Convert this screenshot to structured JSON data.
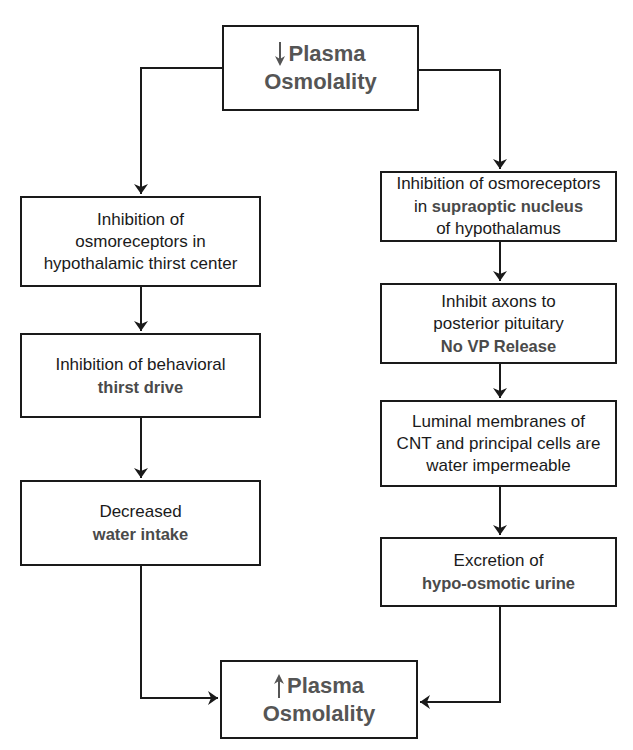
{
  "diagram": {
    "top": {
      "indicator": "decrease",
      "line1": "Plasma",
      "line2": "Osmolality"
    },
    "left_column": [
      {
        "lines": [
          {
            "text": "Inhibition of"
          },
          {
            "text": "osmoreceptors in"
          },
          {
            "text": "hypothalamic thirst center"
          }
        ]
      },
      {
        "lines": [
          {
            "text": "Inhibition of behavioral"
          },
          {
            "text": "thirst drive",
            "emphasis": true
          }
        ]
      },
      {
        "lines": [
          {
            "text": "Decreased"
          },
          {
            "text": "water intake",
            "emphasis": true
          }
        ]
      }
    ],
    "right_column": [
      {
        "lines": [
          {
            "text": "Inhibition of osmoreceptors"
          },
          {
            "pre": "in ",
            "text": "supraoptic nucleus",
            "emphasis": true
          },
          {
            "text": "of hypothalamus"
          }
        ]
      },
      {
        "lines": [
          {
            "text": "Inhibit axons to"
          },
          {
            "text": "posterior pituitary"
          },
          {
            "text": "No VP Release",
            "emphasis": true
          }
        ]
      },
      {
        "lines": [
          {
            "text": "Luminal membranes of"
          },
          {
            "text": "CNT and principal cells are"
          },
          {
            "text": "water impermeable"
          }
        ]
      },
      {
        "lines": [
          {
            "text": "Excretion of"
          },
          {
            "text": "hypo-osmotic urine",
            "emphasis": true
          }
        ]
      }
    ],
    "bottom": {
      "indicator": "increase",
      "line1": "Plasma",
      "line2": "Osmolality"
    }
  },
  "colors": {
    "line": "#1a1a1a",
    "emphasis_text": "#4a4a4a",
    "title_text": "#555555"
  }
}
